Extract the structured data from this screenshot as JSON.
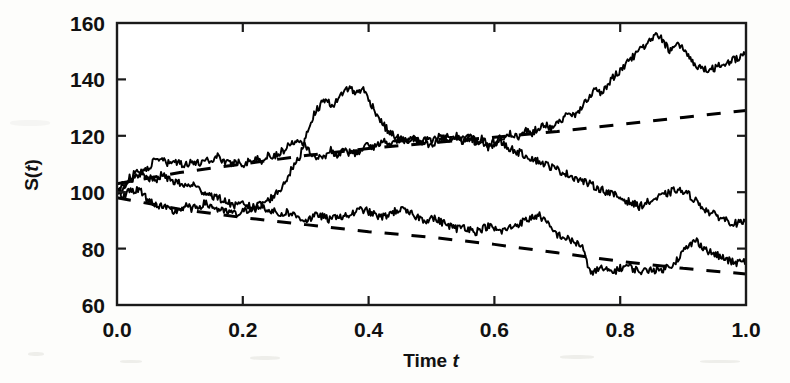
{
  "chart_data": {
    "type": "line",
    "title": "",
    "xlabel": "Time t",
    "ylabel": "S(t)",
    "xlim": [
      0.0,
      1.0
    ],
    "ylim": [
      60,
      160
    ],
    "xticks": [
      0.0,
      0.2,
      0.4,
      0.6,
      0.8,
      1.0
    ],
    "xtick_labels": [
      "0.0",
      "0.2",
      "0.4",
      "0.6",
      "0.8",
      "1.0"
    ],
    "yticks": [
      60,
      80,
      100,
      120,
      140,
      160
    ],
    "ytick_labels": [
      "60",
      "80",
      "100",
      "120",
      "140",
      "160"
    ],
    "grid": false,
    "legend": null,
    "frame": "box",
    "line_color": "#000000",
    "background": "#ffffff",
    "series": [
      {
        "name": "sample-path-1",
        "style": "solid",
        "x": [
          0.0,
          0.01,
          0.02,
          0.03,
          0.04,
          0.05,
          0.06,
          0.07,
          0.08,
          0.09,
          0.1,
          0.11,
          0.12,
          0.13,
          0.14,
          0.15,
          0.16,
          0.17,
          0.18,
          0.19,
          0.2,
          0.21,
          0.22,
          0.23,
          0.24,
          0.25,
          0.26,
          0.27,
          0.28,
          0.29,
          0.3,
          0.31,
          0.32,
          0.33,
          0.34,
          0.35,
          0.36,
          0.37,
          0.38,
          0.39,
          0.4,
          0.41,
          0.42,
          0.43,
          0.44,
          0.45,
          0.46,
          0.47,
          0.48,
          0.49,
          0.5,
          0.51,
          0.52,
          0.53,
          0.54,
          0.55,
          0.56,
          0.57,
          0.58,
          0.59,
          0.6,
          0.61,
          0.62,
          0.63,
          0.64,
          0.65,
          0.66,
          0.67,
          0.68,
          0.69,
          0.7,
          0.71,
          0.72,
          0.73,
          0.74,
          0.75,
          0.76,
          0.77,
          0.78,
          0.79,
          0.8,
          0.81,
          0.82,
          0.83,
          0.84,
          0.85,
          0.86,
          0.87,
          0.88,
          0.89,
          0.9,
          0.91,
          0.92,
          0.93,
          0.94,
          0.95,
          0.96,
          0.97,
          0.98,
          0.99,
          1.0
        ],
        "y": [
          100,
          101,
          104,
          106,
          107,
          109,
          111,
          112,
          110,
          111,
          110,
          110,
          111,
          110,
          112,
          111,
          113,
          111,
          110,
          111,
          110,
          111,
          112,
          111,
          113,
          113,
          114,
          116,
          118,
          119,
          117,
          113,
          112,
          113,
          115,
          113,
          115,
          114,
          114,
          115,
          117,
          116,
          118,
          118,
          117,
          119,
          118,
          119,
          118,
          119,
          118,
          120,
          119,
          118,
          120,
          119,
          120,
          118,
          119,
          117,
          118,
          119,
          121,
          120,
          119,
          122,
          121,
          123,
          124,
          123,
          125,
          126,
          128,
          127,
          131,
          134,
          136,
          135,
          138,
          141,
          143,
          146,
          148,
          150,
          152,
          154,
          156,
          153,
          150,
          152,
          151,
          148,
          145,
          144,
          143,
          144,
          145,
          146,
          147,
          148,
          150
        ]
      },
      {
        "name": "sample-path-2",
        "style": "solid",
        "x": [
          0.0,
          0.01,
          0.02,
          0.03,
          0.04,
          0.05,
          0.06,
          0.07,
          0.08,
          0.09,
          0.1,
          0.11,
          0.12,
          0.13,
          0.14,
          0.15,
          0.16,
          0.17,
          0.18,
          0.19,
          0.2,
          0.21,
          0.22,
          0.23,
          0.24,
          0.25,
          0.26,
          0.27,
          0.28,
          0.29,
          0.3,
          0.31,
          0.32,
          0.33,
          0.34,
          0.35,
          0.36,
          0.37,
          0.38,
          0.39,
          0.4,
          0.41,
          0.42,
          0.43,
          0.44,
          0.45,
          0.46,
          0.47,
          0.48,
          0.49,
          0.5,
          0.51,
          0.52,
          0.53,
          0.54,
          0.55,
          0.56,
          0.57,
          0.58,
          0.59,
          0.6,
          0.61,
          0.62,
          0.63,
          0.64,
          0.65,
          0.66,
          0.67,
          0.68,
          0.69,
          0.7,
          0.71,
          0.72,
          0.73,
          0.74,
          0.75,
          0.76,
          0.77,
          0.78,
          0.79,
          0.8,
          0.81,
          0.82,
          0.83,
          0.84,
          0.85,
          0.86,
          0.87,
          0.88,
          0.89,
          0.9,
          0.91,
          0.92,
          0.93,
          0.94,
          0.95,
          0.96,
          0.97,
          0.98,
          0.99,
          1.0
        ],
        "y": [
          100,
          99,
          100,
          101,
          100,
          97,
          96,
          95,
          94,
          93,
          94,
          95,
          94,
          95,
          96,
          95,
          94,
          93,
          93,
          92,
          93,
          94,
          95,
          96,
          97,
          99,
          101,
          105,
          109,
          112,
          120,
          126,
          130,
          133,
          131,
          132,
          136,
          137,
          135,
          137,
          133,
          129,
          125,
          122,
          120,
          119,
          118,
          119,
          118,
          117,
          116,
          118,
          119,
          120,
          119,
          118,
          119,
          118,
          117,
          116,
          117,
          118,
          116,
          115,
          114,
          113,
          112,
          111,
          110,
          109,
          108,
          107,
          106,
          105,
          104,
          103,
          102,
          101,
          100,
          99,
          98,
          97,
          96,
          95,
          96,
          97,
          98,
          99,
          100,
          101,
          100,
          99,
          97,
          95,
          93,
          92,
          91,
          90,
          89,
          89,
          89
        ]
      },
      {
        "name": "sample-path-3",
        "style": "solid",
        "x": [
          0.0,
          0.01,
          0.02,
          0.03,
          0.04,
          0.05,
          0.06,
          0.07,
          0.08,
          0.09,
          0.1,
          0.11,
          0.12,
          0.13,
          0.14,
          0.15,
          0.16,
          0.17,
          0.18,
          0.19,
          0.2,
          0.21,
          0.22,
          0.23,
          0.24,
          0.25,
          0.26,
          0.27,
          0.28,
          0.29,
          0.3,
          0.31,
          0.32,
          0.33,
          0.34,
          0.35,
          0.36,
          0.37,
          0.38,
          0.39,
          0.4,
          0.41,
          0.42,
          0.43,
          0.44,
          0.45,
          0.46,
          0.47,
          0.48,
          0.49,
          0.5,
          0.51,
          0.52,
          0.53,
          0.54,
          0.55,
          0.56,
          0.57,
          0.58,
          0.59,
          0.6,
          0.61,
          0.62,
          0.63,
          0.64,
          0.65,
          0.66,
          0.67,
          0.68,
          0.69,
          0.7,
          0.71,
          0.72,
          0.73,
          0.74,
          0.75,
          0.76,
          0.77,
          0.78,
          0.79,
          0.8,
          0.81,
          0.82,
          0.83,
          0.84,
          0.85,
          0.86,
          0.87,
          0.88,
          0.89,
          0.9,
          0.91,
          0.92,
          0.93,
          0.94,
          0.95,
          0.96,
          0.97,
          0.98,
          0.99,
          1.0
        ],
        "y": [
          100,
          103,
          105,
          107,
          106,
          105,
          104,
          106,
          105,
          104,
          103,
          102,
          103,
          101,
          100,
          99,
          98,
          97,
          96,
          95,
          96,
          95,
          94,
          95,
          94,
          93,
          92,
          93,
          92,
          91,
          90,
          91,
          92,
          91,
          90,
          92,
          91,
          92,
          93,
          94,
          93,
          92,
          91,
          92,
          93,
          94,
          93,
          92,
          91,
          90,
          91,
          90,
          89,
          88,
          87,
          88,
          87,
          86,
          87,
          88,
          87,
          86,
          87,
          88,
          89,
          90,
          91,
          92,
          90,
          87,
          85,
          84,
          83,
          82,
          81,
          72,
          72,
          73,
          72,
          72,
          73,
          74,
          73,
          72,
          72,
          73,
          72,
          73,
          74,
          76,
          79,
          81,
          83,
          81,
          79,
          78,
          77,
          76,
          75,
          75,
          76
        ]
      },
      {
        "name": "upper-confidence-dashed",
        "style": "dashed",
        "x": [
          0.0,
          0.1,
          0.2,
          0.3,
          0.4,
          0.5,
          0.6,
          0.7,
          0.8,
          0.9,
          1.0
        ],
        "y": [
          103,
          107,
          110,
          113,
          115.5,
          117.5,
          119.5,
          121.5,
          124,
          126.5,
          129
        ]
      },
      {
        "name": "lower-confidence-dashed",
        "style": "dashed",
        "x": [
          0.0,
          0.1,
          0.2,
          0.3,
          0.4,
          0.5,
          0.6,
          0.7,
          0.8,
          0.9,
          1.0
        ],
        "y": [
          98,
          94,
          91,
          88.5,
          86,
          84,
          81.5,
          78.5,
          75.5,
          73,
          71
        ]
      }
    ]
  }
}
